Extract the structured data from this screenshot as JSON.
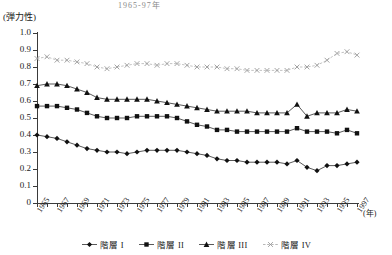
{
  "top_title": "1965-97年",
  "axis": {
    "y_unit_label": "(弾力性)",
    "x_unit_label": "(年)",
    "y_ticks": [
      "1.0",
      "0.9",
      "0.8",
      "0.7",
      "0.6",
      "0.5",
      "0.4",
      "0.3",
      "0.2",
      "0.1",
      "0"
    ],
    "x_ticks": [
      "1965",
      "1967",
      "1969",
      "1971",
      "1973",
      "1975",
      "1977",
      "1979",
      "1981",
      "1983",
      "1985",
      "1987",
      "1989",
      "1991",
      "1993",
      "1995",
      "1997"
    ]
  },
  "legend": {
    "items": [
      {
        "label": "階層 I",
        "marker": "diamond-marker",
        "color": "#111111"
      },
      {
        "label": "階層 II",
        "marker": "square-marker",
        "color": "#111111"
      },
      {
        "label": "階層 III",
        "marker": "triangle-marker",
        "color": "#111111"
      },
      {
        "label": "階層 IV",
        "marker": "cross-marker",
        "color": "#9a9a9a"
      }
    ]
  },
  "chart_data": {
    "type": "line",
    "title": "1965-97年",
    "xlabel": "(年)",
    "ylabel": "(弾力性)",
    "ylim": [
      0,
      1.0
    ],
    "xlim": [
      1965,
      1997
    ],
    "grid": false,
    "legend_position": "bottom",
    "x": [
      1965,
      1966,
      1967,
      1968,
      1969,
      1970,
      1971,
      1972,
      1973,
      1974,
      1975,
      1976,
      1977,
      1978,
      1979,
      1980,
      1981,
      1982,
      1983,
      1984,
      1985,
      1986,
      1987,
      1988,
      1989,
      1990,
      1991,
      1992,
      1993,
      1994,
      1995,
      1996,
      1997
    ],
    "series": [
      {
        "name": "階層 I",
        "marker": "diamond-marker",
        "color": "#111111",
        "values": [
          0.4,
          0.39,
          0.38,
          0.36,
          0.34,
          0.32,
          0.31,
          0.3,
          0.3,
          0.29,
          0.3,
          0.31,
          0.31,
          0.31,
          0.31,
          0.3,
          0.29,
          0.28,
          0.26,
          0.25,
          0.25,
          0.24,
          0.24,
          0.24,
          0.24,
          0.23,
          0.25,
          0.21,
          0.19,
          0.22,
          0.22,
          0.23,
          0.24
        ]
      },
      {
        "name": "階層 II",
        "marker": "square-marker",
        "color": "#111111",
        "values": [
          0.57,
          0.57,
          0.57,
          0.56,
          0.55,
          0.53,
          0.51,
          0.5,
          0.5,
          0.5,
          0.51,
          0.51,
          0.51,
          0.51,
          0.5,
          0.48,
          0.46,
          0.45,
          0.43,
          0.43,
          0.42,
          0.42,
          0.42,
          0.42,
          0.42,
          0.42,
          0.44,
          0.42,
          0.42,
          0.42,
          0.41,
          0.43,
          0.41
        ]
      },
      {
        "name": "階層 III",
        "marker": "triangle-marker",
        "color": "#111111",
        "values": [
          0.69,
          0.7,
          0.7,
          0.69,
          0.67,
          0.65,
          0.62,
          0.61,
          0.61,
          0.61,
          0.61,
          0.61,
          0.6,
          0.59,
          0.58,
          0.57,
          0.56,
          0.55,
          0.54,
          0.54,
          0.54,
          0.54,
          0.53,
          0.53,
          0.53,
          0.53,
          0.58,
          0.51,
          0.53,
          0.53,
          0.53,
          0.55,
          0.54
        ]
      },
      {
        "name": "階層 IV",
        "marker": "cross-marker",
        "color": "#9a9a9a",
        "values": [
          0.85,
          0.86,
          0.84,
          0.84,
          0.83,
          0.82,
          0.8,
          0.79,
          0.8,
          0.81,
          0.82,
          0.82,
          0.81,
          0.82,
          0.82,
          0.81,
          0.8,
          0.8,
          0.8,
          0.79,
          0.79,
          0.78,
          0.78,
          0.78,
          0.78,
          0.78,
          0.8,
          0.8,
          0.81,
          0.84,
          0.88,
          0.89,
          0.87
        ]
      }
    ]
  }
}
